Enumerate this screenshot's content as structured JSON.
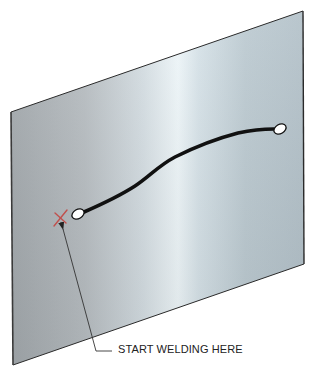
{
  "figure": {
    "type": "technical-illustration",
    "callout": {
      "label": "START WELDING HERE"
    },
    "colors": {
      "plate_edge_dark": "#a8aeb2",
      "plate_highlight": "#eaf4f8",
      "plate_right": "#b4c2ca",
      "plate_outline": "#2a2a2a",
      "weld_bead": "#111111",
      "start_marker": "#c0504d",
      "leader_line": "#333333"
    },
    "marker": {
      "symbol": "x",
      "meaning": "start point"
    }
  }
}
